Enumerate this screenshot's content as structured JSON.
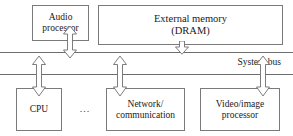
{
  "diagram": {
    "stroke_color": "#7a7a7a",
    "background_color": "#ffffff",
    "text_color": "#1a1a1a"
  },
  "top_row": {
    "audio_processor": {
      "label": "Audio\nprocessor",
      "line1": "Audio",
      "line2": "processor"
    },
    "external_memory": {
      "label": "External memory\n(DRAM)",
      "line1": "External memory",
      "line2": "(DRAM)"
    }
  },
  "bus": {
    "label": "System bus",
    "line_count": 2
  },
  "bottom_row": {
    "cpu": {
      "label": "CPU",
      "line1": "CPU",
      "line2": ""
    },
    "ellipsis": "...",
    "network": {
      "label": "Network/\ncommunication",
      "line1": "Network/",
      "line2": "communication"
    },
    "video": {
      "label": "Video/image\nprocessor",
      "line1": "Video/image",
      "line2": "processor"
    }
  },
  "connectors": [
    {
      "name": "audio-to-bus",
      "type": "double-headed-vertical-block-arrow"
    },
    {
      "name": "dram-to-bus",
      "type": "down-block-arrow"
    },
    {
      "name": "bus-to-cpu",
      "type": "double-headed-vertical-block-arrow"
    },
    {
      "name": "bus-to-network",
      "type": "double-headed-vertical-block-arrow"
    },
    {
      "name": "bus-to-video",
      "type": "double-headed-vertical-block-arrow"
    }
  ]
}
